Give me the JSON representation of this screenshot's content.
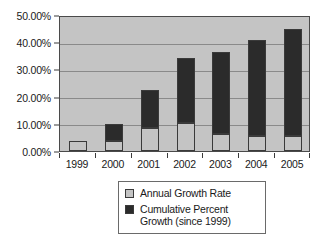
{
  "chart_data": {
    "type": "bar",
    "stacked": true,
    "title": "",
    "subtitle": "",
    "xlabel": "",
    "ylabel": "",
    "categories": [
      "1999",
      "2000",
      "2001",
      "2002",
      "2003",
      "2004",
      "2005"
    ],
    "series": [
      {
        "name": "Annual Growth Rate",
        "color": "#c4c4c4",
        "values": [
          3.7,
          3.7,
          8.5,
          10.2,
          6.2,
          5.5,
          5.5
        ],
        "value_labels": [
          "3.70%",
          "3.70%",
          "8.50%",
          "10.20%",
          "6.20%",
          "5.50%",
          "5.50%"
        ]
      },
      {
        "name": "Cumulative Percent Growth (since 1999)",
        "color": "#2b2b2b",
        "values": [
          3.7,
          10.0,
          22.3,
          34.2,
          36.3,
          40.8,
          44.9
        ],
        "value_labels": [
          "3.70%",
          "10.00%",
          "22.30%",
          "34.20%",
          "36.30%",
          "40.80%",
          "44.90%"
        ]
      }
    ],
    "ylim": [
      0,
      50
    ],
    "y_tick_values": [
      0,
      10,
      20,
      30,
      40,
      50
    ],
    "y_tick_labels": [
      "0.00%",
      "10.00%",
      "20.00%",
      "30.00%",
      "40.00%",
      "50.00%"
    ],
    "grid": true,
    "grid_axis": "y",
    "legend_position": "bottom-center",
    "legend": [
      {
        "label": "Annual Growth Rate",
        "color": "#c4c4c4"
      },
      {
        "label": "Cumulative Percent\nGrowth (since 1999)",
        "color": "#2b2b2b"
      }
    ]
  },
  "legend": {
    "item_1_label": "Annual Growth Rate",
    "item_2_line_1": "Cumulative Percent",
    "item_2_line_2": "Growth (since 1999)"
  },
  "colors": {
    "plot_background": "#c4c4c4",
    "annual_growth": "#c4c4c4",
    "cumulative_growth": "#2b2b2b",
    "axis": "#3a3a3a",
    "gridline": "#8a8a8a",
    "page_background": "#ffffff"
  }
}
